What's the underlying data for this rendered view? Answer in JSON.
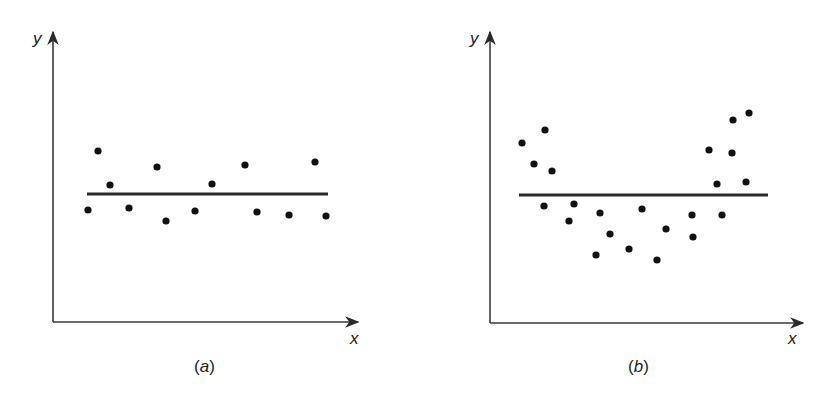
{
  "panels": [
    {
      "id": "a",
      "caption": "(a)",
      "caption_letter": "a",
      "x_label": "x",
      "y_label": "y",
      "description": "Residuals scattered randomly around horizontal line"
    },
    {
      "id": "b",
      "caption": "(b)",
      "caption_letter": "b",
      "x_label": "x",
      "y_label": "y",
      "description": "Residuals forming U-shaped (curved) pattern around horizontal line"
    }
  ],
  "chart_data": [
    {
      "type": "scatter",
      "title": "(a)",
      "xlabel": "x",
      "ylabel": "y",
      "grid": false,
      "reference_line": {
        "orientation": "horizontal",
        "y": 0
      },
      "points_pixel": [
        [
          88,
          210
        ],
        [
          98,
          151
        ],
        [
          110,
          185
        ],
        [
          129,
          208
        ],
        [
          157,
          167
        ],
        [
          166,
          221
        ],
        [
          195,
          211
        ],
        [
          212,
          184
        ],
        [
          245,
          165
        ],
        [
          257,
          212
        ],
        [
          289,
          215
        ],
        [
          315,
          162
        ],
        [
          326,
          216
        ]
      ],
      "series": [
        {
          "name": "points",
          "x": [
            1,
            2,
            3,
            4,
            5,
            6,
            7,
            8,
            9,
            10,
            11,
            12,
            13
          ],
          "values": [
            -16,
            43,
            9,
            -14,
            27,
            -27,
            -17,
            10,
            29,
            -18,
            -21,
            32,
            -22
          ]
        }
      ]
    },
    {
      "type": "scatter",
      "title": "(b)",
      "xlabel": "x",
      "ylabel": "y",
      "grid": false,
      "reference_line": {
        "orientation": "horizontal",
        "y": 0
      },
      "points_pixel": [
        [
          522,
          143
        ],
        [
          545,
          130
        ],
        [
          534,
          164
        ],
        [
          552,
          171
        ],
        [
          544,
          206
        ],
        [
          574,
          204
        ],
        [
          569,
          221
        ],
        [
          600,
          213
        ],
        [
          610,
          234
        ],
        [
          596,
          255
        ],
        [
          629,
          249
        ],
        [
          642,
          209
        ],
        [
          657,
          260
        ],
        [
          666,
          229
        ],
        [
          692,
          215
        ],
        [
          693,
          237
        ],
        [
          709,
          150
        ],
        [
          717,
          184
        ],
        [
          722,
          215
        ],
        [
          733,
          120
        ],
        [
          732,
          153
        ],
        [
          749,
          113
        ],
        [
          746,
          182
        ]
      ],
      "series": [
        {
          "name": "points",
          "x": [
            1,
            2,
            3,
            4,
            5,
            6,
            7,
            8,
            9,
            10,
            11,
            12,
            13,
            14,
            15,
            16,
            17,
            18,
            19,
            20,
            21,
            22,
            23
          ],
          "values": [
            52,
            65,
            31,
            24,
            -11,
            -9,
            -26,
            -18,
            -39,
            -60,
            -54,
            -14,
            -65,
            -34,
            -20,
            -42,
            45,
            11,
            -20,
            75,
            42,
            82,
            13
          ]
        }
      ]
    }
  ]
}
